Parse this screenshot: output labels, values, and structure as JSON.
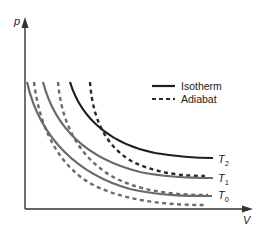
{
  "diagram": {
    "title": "",
    "axes": {
      "y_label": "p",
      "x_label": "V"
    },
    "legend": {
      "items": [
        {
          "label": "Isotherm",
          "style": "solid"
        },
        {
          "label": "Adiabat",
          "style": "dashed"
        }
      ]
    },
    "curve_labels": {
      "t2": {
        "base": "T",
        "sub": "2"
      },
      "t1": {
        "base": "T",
        "sub": "1"
      },
      "t0": {
        "base": "T",
        "sub": "0"
      }
    },
    "colors": {
      "axis": "#333333",
      "isotherm_t2": "#1e1e1e",
      "isotherm_other": "#6a6a6a",
      "adiabat_hot": "#2a2a2a",
      "adiabat_other": "#6a6a6a"
    },
    "curves": [
      {
        "name": "isotherm-T2",
        "style": "solid",
        "color": "dark",
        "start": [
          70,
          82
        ],
        "end": [
          213,
          158
        ]
      },
      {
        "name": "isotherm-T1",
        "style": "solid",
        "color": "gray",
        "start": [
          43,
          82
        ],
        "end": [
          213,
          178
        ]
      },
      {
        "name": "isotherm-T0",
        "style": "solid",
        "color": "gray",
        "start": [
          27,
          82
        ],
        "end": [
          212,
          196
        ]
      },
      {
        "name": "adiabat-1",
        "style": "dashed",
        "color": "dark",
        "start": [
          90,
          82
        ],
        "end": [
          205,
          176
        ]
      },
      {
        "name": "adiabat-2",
        "style": "dashed",
        "color": "gray",
        "start": [
          58,
          82
        ],
        "end": [
          208,
          195
        ]
      },
      {
        "name": "adiabat-3",
        "style": "dashed",
        "color": "gray",
        "start": [
          34,
          82
        ],
        "end": [
          205,
          205
        ]
      }
    ]
  }
}
